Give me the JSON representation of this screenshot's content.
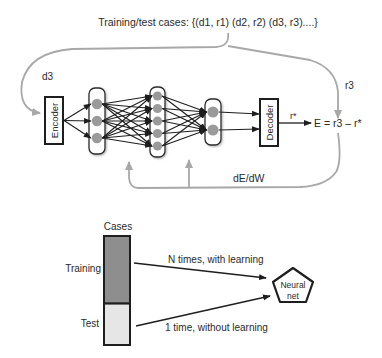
{
  "top_diagram": {
    "title": "Training/test cases: {(d1, r1) (d2, r2) (d3, r3)....}",
    "input_label": "d3",
    "target_label": "r3",
    "encoder_label": "Encoder",
    "decoder_label": "Decoder",
    "output_label": "r*",
    "error_formula": "E = r3 – r*",
    "gradient_label": "dE/dW",
    "layers": [
      {
        "name": "input-layer",
        "nodes": 3
      },
      {
        "name": "hidden-layer",
        "nodes": 5
      },
      {
        "name": "output-layer",
        "nodes": 2
      }
    ]
  },
  "bottom_diagram": {
    "bar_title": "Cases",
    "training_label": "Training",
    "test_label": "Test",
    "training_fraction": 0.62,
    "training_arrow_label": "N times, with learning",
    "test_arrow_label": "1 time, without learning",
    "net_label_line1": "Neural",
    "net_label_line2": "net"
  },
  "colors": {
    "stroke": "#1e1e1e",
    "feedback_arrow": "#a8a8a8",
    "node_fill": "#9a9a9a",
    "training_fill": "#8e8e8e",
    "test_fill": "#e6e6e6",
    "layer_fill": "#ffffff"
  }
}
